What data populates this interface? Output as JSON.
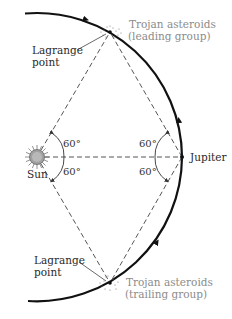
{
  "diagram": {
    "colors": {
      "orbit": "#111111",
      "dashed_lines": "#555555",
      "sun_fill": "#9a9a9a",
      "label_dark": "#2a2a2a",
      "label_grey": "#8c8c8c"
    },
    "labels": {
      "sun": "Sun",
      "jupiter": "Jupiter",
      "lagrange_top_line1": "Lagrange",
      "lagrange_top_line2": "point",
      "lagrange_bottom_line1": "Lagrange",
      "lagrange_bottom_line2": "point",
      "trojan_leading_line1": "Trojan asteroids",
      "trojan_leading_line2": "(leading group)",
      "trojan_trailing_line1": "Trojan asteroids",
      "trojan_trailing_line2": "(trailing group)"
    },
    "angles": {
      "sun_upper": "60°",
      "sun_lower": "60°",
      "jupiter_upper": "60°",
      "jupiter_lower": "60°"
    },
    "nodes": [
      {
        "id": "sun",
        "x": 37,
        "y": 157
      },
      {
        "id": "jupiter",
        "x": 182,
        "y": 157
      },
      {
        "id": "l4_leading",
        "x": 110,
        "y": 32
      },
      {
        "id": "l5_trailing",
        "x": 110,
        "y": 283
      }
    ]
  }
}
